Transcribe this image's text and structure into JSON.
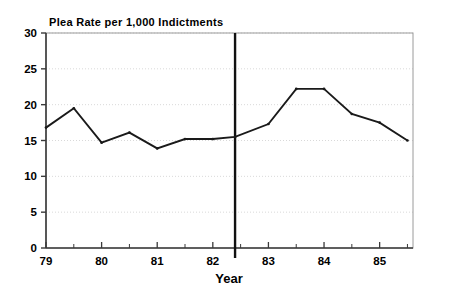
{
  "chart_data": {
    "type": "line",
    "title": "Plea Rate per 1,000 Indictments",
    "xlabel": "Year",
    "ylabel": "",
    "xlim": [
      79.0,
      85.6
    ],
    "ylim": [
      0,
      30
    ],
    "grid": true,
    "legend": "none",
    "xticks": [
      "79",
      "80",
      "81",
      "82",
      "83",
      "84",
      "85"
    ],
    "xtick_values": [
      79,
      80,
      81,
      82,
      83,
      84,
      85
    ],
    "minor_xticks": [
      79.5,
      80.5,
      81.5,
      82.5,
      83.5,
      84.5,
      85.5
    ],
    "yticks": [
      "0",
      "5",
      "10",
      "15",
      "20",
      "25",
      "30"
    ],
    "ytick_values": [
      0,
      5,
      10,
      15,
      20,
      25,
      30
    ],
    "x": [
      79.0,
      79.5,
      80.0,
      80.5,
      81.0,
      81.5,
      82.0,
      82.4,
      83.0,
      83.5,
      84.0,
      84.5,
      85.0,
      85.5
    ],
    "values": [
      16.8,
      19.5,
      14.7,
      16.1,
      13.9,
      15.2,
      15.2,
      15.5,
      17.3,
      22.2,
      22.2,
      18.7,
      17.5,
      15.0
    ],
    "series": [
      {
        "name": "Plea Rate",
        "values": [
          16.8,
          19.5,
          14.7,
          16.1,
          13.9,
          15.2,
          15.2,
          15.5,
          17.3,
          22.2,
          22.2,
          18.7,
          17.5,
          15.0
        ]
      }
    ],
    "annotations": [
      {
        "type": "vertical-reference-line",
        "x": 82.4,
        "label": ""
      }
    ],
    "colors": {
      "line": "#1a1a1a",
      "grid": "#d9d9d9",
      "axis": "#555555",
      "frame": "#999999",
      "marker": "#1a1a1a",
      "reference_line": "#111111",
      "background": "#ffffff"
    }
  }
}
